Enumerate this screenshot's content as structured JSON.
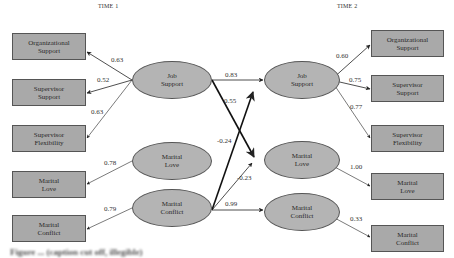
{
  "figure": {
    "time_labels": [
      "TIME 1",
      "TIME 2"
    ],
    "caption": "Figure ... (caption cut off, illegible)"
  },
  "time1": {
    "indicators": [
      {
        "label": "Organizational\nSupport",
        "loading": "0.63"
      },
      {
        "label": "Supervisor\nSupport",
        "loading": "0.52"
      },
      {
        "label": "Supervisor\nFlexibility",
        "loading": "0.63"
      },
      {
        "label": "Marital\nLove",
        "loading": "0.78"
      },
      {
        "label": "Marital\nConflict",
        "loading": "0.79"
      }
    ],
    "latents": [
      {
        "label": "Job\nSupport"
      },
      {
        "label": "Marital\nLove"
      },
      {
        "label": "Marital\nConflict"
      }
    ]
  },
  "time2": {
    "indicators": [
      {
        "label": "Organizational\nSupport",
        "loading": "0.60"
      },
      {
        "label": "Supervisor\nSupport",
        "loading": "0.75"
      },
      {
        "label": "Supervisor\nFlexibility",
        "loading": "0.77"
      },
      {
        "label": "Marital\nLove",
        "loading": "1.00"
      },
      {
        "label": "Marital\nConflict",
        "loading": "0.33"
      }
    ],
    "latents": [
      {
        "label": "Job\nSupport"
      },
      {
        "label": "Marital\nLove"
      },
      {
        "label": "Marital\nConflict"
      }
    ]
  },
  "paths": [
    {
      "from": "T1 Job Support",
      "to": "T2 Job Support",
      "coef": "0.83"
    },
    {
      "from": "T1 Job Support",
      "to": "T2 Marital Love",
      "coef": "0.55",
      "emphasis": "bold"
    },
    {
      "from": "T1 Marital Conflict",
      "to": "T2 Job Support",
      "coef": "-0.24",
      "emphasis": "bold"
    },
    {
      "from": "T1 Marital Conflict",
      "to": "T2 Marital Love",
      "coef": "-0.23"
    },
    {
      "from": "T1 Marital Conflict",
      "to": "T2 Marital Conflict",
      "coef": "0.99"
    }
  ],
  "colors": {
    "box_fill": "#a9a9a9",
    "ellipse_fill": "#b4b4b4",
    "stroke": "#555555",
    "arrow": "#222222"
  }
}
